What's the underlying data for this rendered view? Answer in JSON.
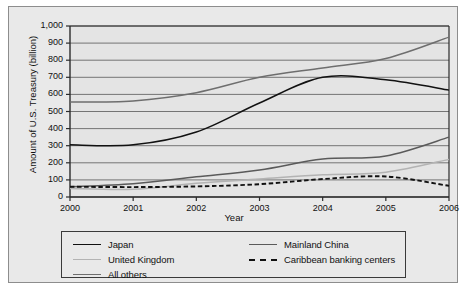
{
  "chart_data": {
    "type": "line",
    "title": "",
    "xlabel": "Year",
    "ylabel": "Amount of U.S. Treasury (billion)",
    "x": [
      2000,
      2001,
      2002,
      2003,
      2004,
      2005,
      2006
    ],
    "xtick_labels": [
      "2000",
      "2001",
      "2002",
      "2003",
      "2004",
      "2005",
      "2006"
    ],
    "ytick_labels": [
      "0",
      "100",
      "200",
      "300",
      "400",
      "500",
      "600",
      "700",
      "800",
      "900",
      "1,000"
    ],
    "ytick_values": [
      0,
      100,
      200,
      300,
      400,
      500,
      600,
      700,
      800,
      900,
      1000
    ],
    "ylim": [
      0,
      1000
    ],
    "xlim": [
      2000,
      2006
    ],
    "grid": "horizontal",
    "legend_position": "below-plot",
    "series": [
      {
        "name": "All others",
        "color": "#6e6e6e",
        "style": "solid",
        "values": [
          555,
          562,
          610,
          700,
          755,
          810,
          935
        ]
      },
      {
        "name": "Japan",
        "color": "#111111",
        "style": "solid",
        "values": [
          305,
          305,
          380,
          550,
          700,
          685,
          625
        ]
      },
      {
        "name": "Mainland China",
        "color": "#5a5a5a",
        "style": "solid",
        "values": [
          60,
          78,
          118,
          158,
          222,
          240,
          350
        ]
      },
      {
        "name": "United Kingdom",
        "color": "#b3b3b3",
        "style": "solid",
        "values": [
          50,
          45,
          80,
          105,
          130,
          145,
          220
        ]
      },
      {
        "name": "Caribbean banking centers",
        "color": "#111111",
        "style": "dashed",
        "values": [
          60,
          58,
          62,
          75,
          105,
          120,
          65
        ]
      }
    ]
  },
  "legend": {
    "entries": [
      {
        "label": "Japan",
        "color": "#111111",
        "style": "solid"
      },
      {
        "label": "Mainland China",
        "color": "#5a5a5a",
        "style": "solid"
      },
      {
        "label": "United Kingdom",
        "color": "#b3b3b3",
        "style": "solid"
      },
      {
        "label": "Caribbean banking centers",
        "color": "#111111",
        "style": "dashed"
      },
      {
        "label": "All others",
        "color": "#6e6e6e",
        "style": "solid"
      }
    ]
  }
}
